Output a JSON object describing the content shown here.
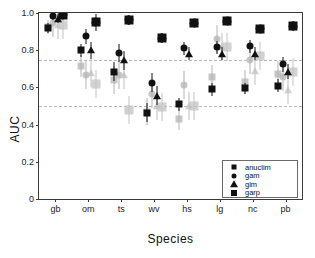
{
  "chart_data": {
    "type": "scatter",
    "title": "",
    "xlabel": "Species",
    "ylabel": "AUC",
    "ylim": [
      0,
      1.0
    ],
    "grid": false,
    "legend_position": "bottom-right",
    "categories": [
      "gb",
      "om",
      "ts",
      "wv",
      "hs",
      "lg",
      "nc",
      "pb"
    ],
    "yticks": [
      "0",
      "0.2",
      "0.4",
      "0.6",
      "0.8",
      "1.0"
    ],
    "ytick_values": [
      0,
      0.2,
      0.4,
      0.6,
      0.8,
      1.0
    ],
    "reference_lines": [
      {
        "value": 0.75,
        "style": "dash-dot",
        "color": "#b9b9b9"
      },
      {
        "value": 0.5,
        "style": "dash-dot",
        "color": "#b9b9b9"
      }
    ],
    "series": [
      {
        "name": "anuclim",
        "marker": "square",
        "color": "#111111",
        "values": [
          0.92,
          0.8,
          0.685,
          0.465,
          0.51,
          0.59,
          0.595,
          0.61
        ],
        "err_low": [
          0.895,
          0.765,
          0.635,
          0.415,
          0.475,
          0.555,
          0.565,
          0.575
        ],
        "err_high": [
          0.945,
          0.835,
          0.735,
          0.515,
          0.545,
          0.625,
          0.625,
          0.645
        ]
      },
      {
        "name": "gam",
        "marker": "circle",
        "color": "#111111",
        "values": [
          0.985,
          0.875,
          0.785,
          0.625,
          0.81,
          0.815,
          0.82,
          0.725
        ],
        "err_low": [
          0.965,
          0.835,
          0.735,
          0.575,
          0.775,
          0.78,
          0.785,
          0.685
        ],
        "err_high": [
          1.0,
          0.915,
          0.835,
          0.675,
          0.845,
          0.85,
          0.855,
          0.765
        ]
      },
      {
        "name": "glm",
        "marker": "triangle",
        "color": "#111111",
        "values": [
          0.97,
          0.8,
          0.745,
          0.555,
          0.78,
          0.78,
          0.78,
          0.685
        ],
        "err_low": [
          0.945,
          0.755,
          0.695,
          0.505,
          0.745,
          0.745,
          0.745,
          0.645
        ],
        "err_high": [
          0.995,
          0.845,
          0.795,
          0.605,
          0.815,
          0.815,
          0.815,
          0.725
        ]
      },
      {
        "name": "garp",
        "marker": "plus",
        "color": "#111111",
        "values": [
          0.99,
          0.95,
          0.965,
          0.865,
          0.945,
          0.955,
          0.915,
          0.93
        ],
        "err_low": [
          0.975,
          0.905,
          0.935,
          0.84,
          0.925,
          0.94,
          0.895,
          0.905
        ],
        "err_high": [
          1.0,
          0.995,
          0.99,
          0.89,
          0.965,
          0.975,
          0.935,
          0.955
        ]
      }
    ],
    "faded_series": [
      {
        "name": "anuclim-faded",
        "marker": "square",
        "color": "#b3b3b3",
        "values": [
          0.925,
          0.715,
          0.64,
          0.47,
          0.43,
          0.655,
          0.63,
          0.67
        ],
        "err_low": [
          0.885,
          0.655,
          0.565,
          0.4,
          0.37,
          0.59,
          0.565,
          0.6
        ],
        "err_high": [
          0.96,
          0.775,
          0.715,
          0.545,
          0.49,
          0.72,
          0.695,
          0.74
        ]
      },
      {
        "name": "gam-faded",
        "marker": "circle",
        "color": "#b3b3b3",
        "values": [
          0.945,
          0.665,
          0.665,
          0.565,
          0.615,
          0.86,
          0.75,
          0.655
        ]
      },
      {
        "name": "glm-faded",
        "marker": "triangle",
        "color": "#c0c0c0",
        "values": [
          0.935,
          0.675,
          0.665,
          0.5,
          0.5,
          0.815,
          0.69,
          0.585
        ]
      },
      {
        "name": "garp-faded",
        "marker": "plus",
        "color": "#c4c4c4",
        "values": [
          0.935,
          0.62,
          0.48,
          0.495,
          0.5,
          0.815,
          0.77,
          0.685
        ]
      }
    ]
  },
  "legend": {
    "entries": [
      {
        "label": "anuclim",
        "marker": "square"
      },
      {
        "label": "gam",
        "marker": "circle"
      },
      {
        "label": "glm",
        "marker": "triangle"
      },
      {
        "label": "garp",
        "marker": "plus"
      }
    ]
  }
}
